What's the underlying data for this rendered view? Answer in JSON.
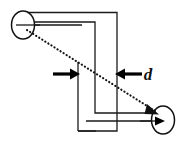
{
  "figure": {
    "background_color": "#ffffff",
    "line_color": "#1a1a1a",
    "ray_color": "#111111",
    "width": 181,
    "height": 147
  },
  "labels": {
    "distance": "d"
  },
  "elements": {
    "left_aperture_name": "entrance opening",
    "right_aperture_name": "exit opening",
    "ray_name": "dotted sight line",
    "dimension_name": "tube separation d"
  },
  "geometry": {
    "left_aperture": {
      "cx": 23,
      "cy": 25,
      "rx": 11,
      "ry": 14
    },
    "right_aperture": {
      "cx": 163,
      "cy": 120,
      "rx": 11,
      "ry": 14
    },
    "ray_start": {
      "x": 28,
      "y": 30
    },
    "ray_end": {
      "x": 160,
      "y": 113
    },
    "dim_left_arrow": {
      "x1": 53,
      "y1": 74,
      "x2": 77,
      "y2": 74
    },
    "dim_right_arrow": {
      "x1": 140,
      "y1": 74,
      "x2": 118,
      "y2": 74
    },
    "dim_label": {
      "x": 148,
      "y": 79
    },
    "outer_wall_points": "23,13 117,13 117,131 78,131",
    "inner_wall_points": "23,22 95,22 95,113 163,113",
    "top_axis": {
      "x1": 16,
      "y1": 25,
      "x2": 84,
      "y2": 25
    },
    "bottom_axis": {
      "x1": 84,
      "y1": 121,
      "x2": 162,
      "y2": 121
    }
  }
}
